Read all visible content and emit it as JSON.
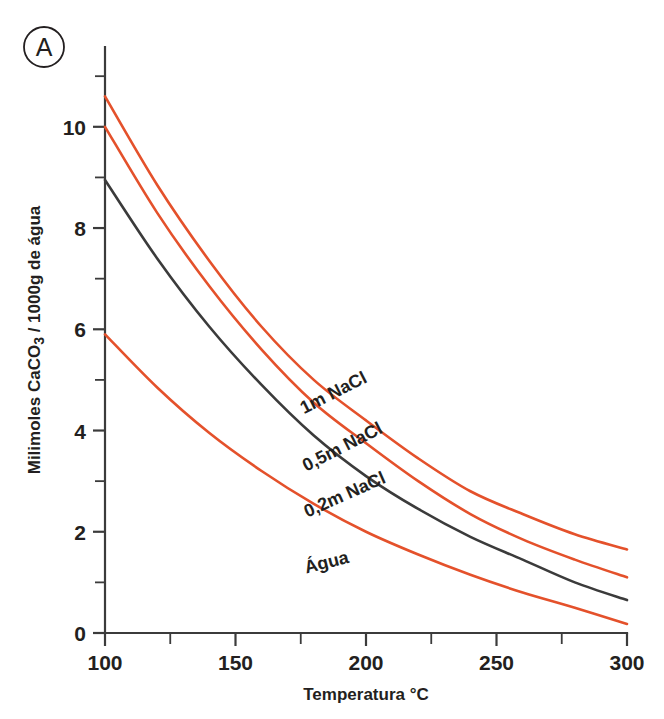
{
  "figure": {
    "panel_letter": "A",
    "background": "#ffffff"
  },
  "axis": {
    "x_title": "Temperatura °C",
    "y_title_prefix": "Milimoles CaCO",
    "y_title_sub": "3",
    "y_title_suffix": " / 1000g de água",
    "x_ticks": [
      "100",
      "150",
      "200",
      "250",
      "300"
    ],
    "y_ticks": [
      "0",
      "2",
      "4",
      "6",
      "8",
      "10"
    ],
    "x_minor_ticks": [
      "125",
      "175",
      "225",
      "275"
    ],
    "y_minor_ticks": [
      "1",
      "3",
      "5",
      "7",
      "9",
      "11"
    ]
  },
  "colors": {
    "orange": "#E4512B",
    "black": "#3b3b3b",
    "text": "#231f20"
  },
  "series_labels": {
    "s1m": "1m NaCl",
    "s05m": "0,5m NaCl",
    "s02m": "0,2m NaCl",
    "agua": "Água"
  },
  "chart_data": {
    "type": "line",
    "title": "",
    "xlabel": "Temperatura °C",
    "ylabel": "Milimoles CaCO3 / 1000g de água",
    "xlim": [
      100,
      300
    ],
    "ylim": [
      0,
      11.3
    ],
    "xticks": [
      100,
      150,
      200,
      250,
      300
    ],
    "yticks": [
      0,
      2,
      4,
      6,
      8,
      10
    ],
    "xminorticks": [
      125,
      175,
      225,
      275
    ],
    "yminorticks": [
      1,
      3,
      5,
      7,
      9,
      11
    ],
    "grid": false,
    "legend": "inline-curve-labels",
    "x": [
      100,
      120,
      140,
      160,
      180,
      200,
      220,
      240,
      260,
      280,
      300
    ],
    "series": [
      {
        "name": "1m NaCl",
        "color": "#E4512B",
        "values": [
          10.6,
          8.85,
          7.35,
          6.05,
          5.0,
          4.2,
          3.45,
          2.8,
          2.35,
          1.95,
          1.65
        ]
      },
      {
        "name": "0,5m NaCl",
        "color": "#E4512B",
        "values": [
          10.0,
          8.3,
          6.85,
          5.6,
          4.55,
          3.75,
          3.0,
          2.35,
          1.85,
          1.45,
          1.1
        ]
      },
      {
        "name": "0,2m NaCl",
        "color": "#3b3b3b",
        "values": [
          8.95,
          7.4,
          6.05,
          4.9,
          3.9,
          3.1,
          2.45,
          1.9,
          1.45,
          1.0,
          0.65
        ]
      },
      {
        "name": "Água",
        "color": "#E4512B",
        "values": [
          5.9,
          4.85,
          3.95,
          3.2,
          2.55,
          2.0,
          1.55,
          1.15,
          0.8,
          0.5,
          0.18
        ]
      }
    ]
  }
}
